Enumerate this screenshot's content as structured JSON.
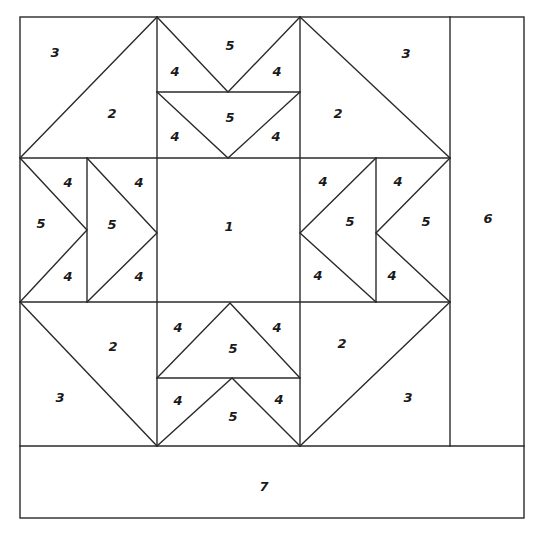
{
  "diagram": {
    "title": "",
    "colors": {
      "background": "#ffffff",
      "line": "#2a2a2a",
      "label": "#1a1a1a"
    },
    "labels": {
      "tl_corner_3": "3",
      "tl_corner_2": "2",
      "top_goose_upper_left4": "4",
      "top_goose_upper_5": "5",
      "top_goose_upper_right4": "4",
      "top_goose_lower_left4": "4",
      "top_goose_lower_5": "5",
      "top_goose_lower_right4": "4",
      "tr_corner_2": "2",
      "tr_corner_3": "3",
      "left_goose_outer_top4": "4",
      "left_goose_outer_5": "5",
      "left_goose_outer_bottom4": "4",
      "left_goose_inner_top4": "4",
      "left_goose_inner_5": "5",
      "left_goose_inner_bottom4": "4",
      "center_1": "1",
      "right_goose_inner_top4": "4",
      "right_goose_inner_5": "5",
      "right_goose_inner_bottom4": "4",
      "right_goose_outer_top4": "4",
      "right_goose_outer_5": "5",
      "right_goose_outer_bottom4": "4",
      "bl_corner_2": "2",
      "bl_corner_3": "3",
      "bottom_goose_upper_left4": "4",
      "bottom_goose_upper_5": "5",
      "bottom_goose_upper_right4": "4",
      "bottom_goose_lower_left4": "4",
      "bottom_goose_lower_5": "5",
      "bottom_goose_lower_right4": "4",
      "br_corner_2": "2",
      "br_corner_3": "3",
      "border_right_6": "6",
      "border_bottom_7": "7"
    }
  }
}
